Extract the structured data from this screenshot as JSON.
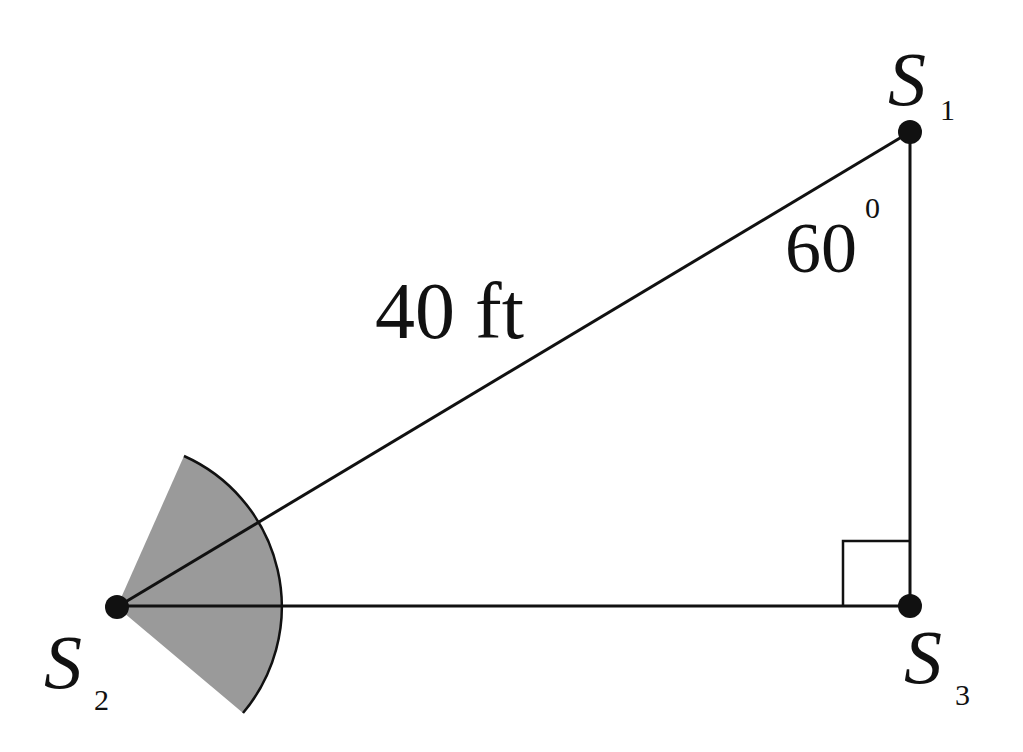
{
  "diagram": {
    "type": "right-triangle-geometry",
    "colors": {
      "line": "#111111",
      "sector_fill": "#9a9a9a",
      "background": "#ffffff"
    },
    "points": [
      {
        "id": "S1",
        "letter": "S",
        "subscript": "1",
        "x": 910,
        "y": 132
      },
      {
        "id": "S2",
        "letter": "S",
        "subscript": "2",
        "x": 117,
        "y": 607
      },
      {
        "id": "S3",
        "letter": "S",
        "subscript": "3",
        "x": 910,
        "y": 606
      }
    ],
    "edges": [
      {
        "from": "S2",
        "to": "S1",
        "label": "40 ft"
      },
      {
        "from": "S1",
        "to": "S3",
        "label": ""
      },
      {
        "from": "S2",
        "to": "S3",
        "label": ""
      }
    ],
    "angle_label": {
      "value": "60",
      "superscript": "0",
      "at": "S1"
    },
    "right_angle_marker": {
      "at": "S3"
    },
    "shaded_sector": {
      "center": "S2",
      "radius": 165,
      "start_angle_deg": -66,
      "end_angle_deg": 40
    }
  }
}
